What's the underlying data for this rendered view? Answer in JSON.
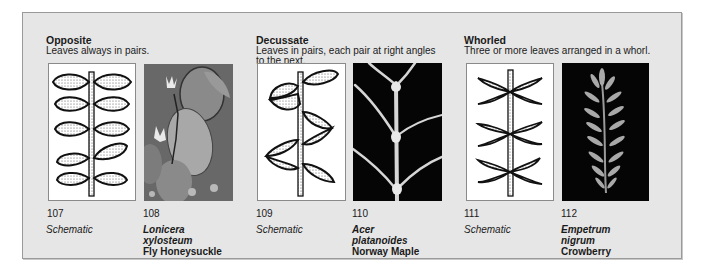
{
  "groups": [
    {
      "title": "Opposite",
      "description": "Leaves always in pairs.",
      "figures": [
        {
          "number": "107",
          "caption": "Schematic",
          "type": "schematic"
        },
        {
          "number": "108",
          "latin_1": "Lonicera",
          "latin_2": "xylosteum",
          "common": "Fly Honeysuckle",
          "type": "photo"
        }
      ]
    },
    {
      "title": "Decussate",
      "description_1": "Leaves in pairs, each pair at right angles",
      "description_2": "to the next.",
      "figures": [
        {
          "number": "109",
          "caption": "Schematic",
          "type": "schematic"
        },
        {
          "number": "110",
          "latin_1": "Acer",
          "latin_2": "platanoides",
          "common": "Norway Maple",
          "type": "photo"
        }
      ]
    },
    {
      "title": "Whorled",
      "description": "Three or more leaves arranged in a whorl.",
      "figures": [
        {
          "number": "111",
          "caption": "Schematic",
          "type": "schematic"
        },
        {
          "number": "112",
          "latin_1": "Empetrum",
          "latin_2": "nigrum",
          "common": "Crowberry",
          "type": "photo"
        }
      ]
    }
  ],
  "colors": {
    "panel_bg": "#e6e6e6",
    "panel_border": "#9a9a9a",
    "photo_dark_bg": "#050505",
    "text": "#1a1a1a"
  }
}
